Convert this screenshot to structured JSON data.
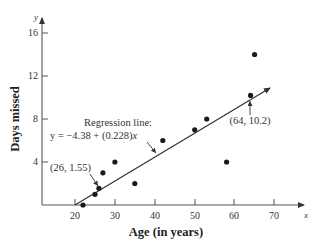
{
  "chart_data": {
    "type": "scatter",
    "title": "",
    "xlabel": "Age (in years)",
    "ylabel": "Days missed",
    "x_axis_var": "x",
    "y_axis_var": "y",
    "xlim": [
      10,
      72
    ],
    "ylim": [
      0,
      17
    ],
    "x_ticks": [
      20,
      30,
      40,
      50,
      60,
      70
    ],
    "y_ticks": [
      4,
      8,
      12,
      16
    ],
    "grid": false,
    "legend": null,
    "series": [
      {
        "name": "Observations",
        "points": [
          {
            "x": 22,
            "y": 0
          },
          {
            "x": 25,
            "y": 1
          },
          {
            "x": 26,
            "y": 1.55
          },
          {
            "x": 27,
            "y": 3
          },
          {
            "x": 30,
            "y": 4
          },
          {
            "x": 35,
            "y": 2
          },
          {
            "x": 42,
            "y": 6
          },
          {
            "x": 50,
            "y": 7
          },
          {
            "x": 53,
            "y": 8
          },
          {
            "x": 58,
            "y": 4
          },
          {
            "x": 64,
            "y": 10.2
          },
          {
            "x": 65,
            "y": 14
          }
        ]
      }
    ],
    "regression_line": {
      "intercept": -4.38,
      "slope": 0.228,
      "x_start": 19.2,
      "x_end": 68
    },
    "annotations": [
      {
        "text_line1": "Regression line:",
        "text_line2_prefix": "y = −4.38 + (0.228)",
        "text_line2_var": "x"
      },
      {
        "text": "(26, 1.55)",
        "point": {
          "x": 26,
          "y": 1.55
        }
      },
      {
        "text": "(64, 10.2)",
        "point": {
          "x": 64,
          "y": 10.2
        }
      }
    ]
  },
  "labels": {
    "x_title": "Age (in years)",
    "y_title": "Days missed",
    "x_var": "x",
    "y_var": "y",
    "reg_line1": "Regression line:",
    "reg_line2_prefix": "y = −4.38 + (0.228)",
    "reg_line2_var": "x",
    "pt1": "(26, 1.55)",
    "pt2": "(64, 10.2)",
    "xt0": "20",
    "xt1": "30",
    "xt2": "40",
    "xt3": "50",
    "xt4": "60",
    "xt5": "70",
    "yt0": "4",
    "yt1": "8",
    "yt2": "12",
    "yt3": "16"
  }
}
